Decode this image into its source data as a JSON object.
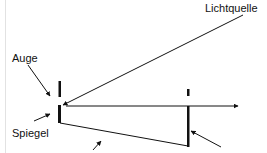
{
  "diagram": {
    "labels": {
      "light_source": "Lichtquelle",
      "eye": "Auge",
      "mirror": "Spiegel"
    },
    "colors": {
      "stroke": "#111111",
      "background": "#ffffff",
      "border": "#e2e2e2"
    }
  }
}
